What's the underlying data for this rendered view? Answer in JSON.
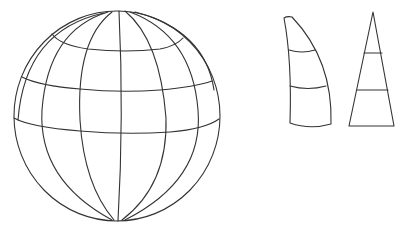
{
  "diagram": {
    "description": "Globe with latitude/longitude grid beside an unrolled gore segment and its flat triangular projection",
    "stroke_color": "#333333",
    "background": "#ffffff",
    "globe": {
      "label": "globe",
      "center": [
        117,
        116
      ],
      "rx": 103,
      "ry": 105,
      "latitude_lines": 3,
      "meridians": 7
    },
    "gore": {
      "label": "curved gore segment",
      "bands": 3
    },
    "triangle": {
      "label": "flat triangular projection",
      "bands": 3
    }
  }
}
